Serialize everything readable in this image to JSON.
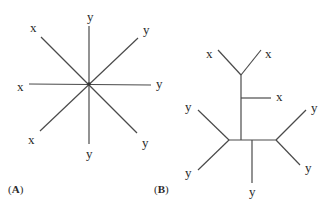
{
  "panels": {
    "a": {
      "label_open": "(",
      "label_letter": "A",
      "label_close": ")",
      "type": "star phylogeny",
      "leaves": [
        {
          "name": "x",
          "position": "upper-left"
        },
        {
          "name": "y",
          "position": "top"
        },
        {
          "name": "y",
          "position": "upper-right"
        },
        {
          "name": "x",
          "position": "left"
        },
        {
          "name": "y",
          "position": "right"
        },
        {
          "name": "x",
          "position": "lower-left"
        },
        {
          "name": "y",
          "position": "bottom"
        },
        {
          "name": "y",
          "position": "lower-right"
        }
      ]
    },
    "b": {
      "label_open": "(",
      "label_letter": "B",
      "label_close": ")",
      "type": "bifurcating tree",
      "leaves": [
        {
          "name": "x",
          "position": "top-left"
        },
        {
          "name": "x",
          "position": "top-right"
        },
        {
          "name": "x",
          "position": "middle-right"
        },
        {
          "name": "y",
          "position": "left-upper"
        },
        {
          "name": "y",
          "position": "left-lower"
        },
        {
          "name": "y",
          "position": "bottom"
        },
        {
          "name": "y",
          "position": "right-upper"
        },
        {
          "name": "y",
          "position": "right-lower"
        }
      ]
    }
  },
  "colors": {
    "line": "#4a4a4a",
    "text": "#2a2a2a",
    "background": "#ffffff"
  }
}
